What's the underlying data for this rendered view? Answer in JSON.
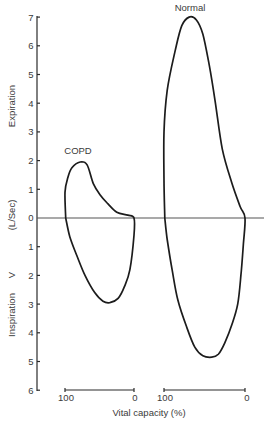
{
  "chart_data": {
    "type": "line",
    "title": "",
    "subtitle": "",
    "xlabel": "Vital capacity (%)",
    "ylabel": "V (L/Sec)",
    "ylabel_upper": "Expiration",
    "ylabel_lower": "Inspiration",
    "ylabel_unit": "(L/Sec)",
    "ylabel_symbol": "V",
    "ylim": [
      -6,
      7
    ],
    "y_ticks_expiration": [
      "7",
      "6",
      "5",
      "4",
      "3",
      "2",
      "1",
      "0"
    ],
    "y_ticks_inspiration": [
      "1",
      "2",
      "3",
      "4",
      "5",
      "6"
    ],
    "grid": false,
    "legend": "none (curves labeled directly)",
    "x_scales": [
      {
        "name": "COPD",
        "left_label": "100",
        "right_label": "0",
        "range": [
          100,
          0
        ]
      },
      {
        "name": "Normal",
        "left_label": "100",
        "right_label": "0",
        "range": [
          100,
          0
        ]
      }
    ],
    "series": [
      {
        "name": "COPD",
        "label": "COPD",
        "note": "points are [vital capacity %, flow L/s]; positive = expiration, negative = inspiration",
        "points": [
          [
            99,
            0
          ],
          [
            100,
            0.9
          ],
          [
            96,
            1.4
          ],
          [
            90,
            1.75
          ],
          [
            78,
            1.95
          ],
          [
            68,
            1.85
          ],
          [
            59,
            1.2
          ],
          [
            49,
            0.8
          ],
          [
            38,
            0.5
          ],
          [
            25,
            0.2
          ],
          [
            9,
            0.1
          ],
          [
            0,
            0
          ],
          [
            0,
            -0.6
          ],
          [
            6,
            -1.8
          ],
          [
            14,
            -2.4
          ],
          [
            23,
            -2.8
          ],
          [
            35,
            -2.95
          ],
          [
            45,
            -2.9
          ],
          [
            57,
            -2.6
          ],
          [
            71,
            -2.0
          ],
          [
            83,
            -1.3
          ],
          [
            93,
            -0.65
          ],
          [
            99,
            0
          ]
        ],
        "peak_expiratory_flow": 2.0,
        "peak_inspiratory_flow": 2.9
      },
      {
        "name": "Normal",
        "label": "Normal",
        "note": "points are [vital capacity %, flow L/s]; positive = expiration, negative = inspiration",
        "points": [
          [
            99,
            0
          ],
          [
            100,
            1.3
          ],
          [
            100,
            3.0
          ],
          [
            96,
            4.45
          ],
          [
            86,
            5.85
          ],
          [
            78,
            6.7
          ],
          [
            69,
            7.0
          ],
          [
            60,
            6.9
          ],
          [
            52,
            6.4
          ],
          [
            44,
            5.3
          ],
          [
            37,
            4.1
          ],
          [
            28,
            2.4
          ],
          [
            16,
            1.2
          ],
          [
            6,
            0.4
          ],
          [
            0,
            0
          ],
          [
            2,
            -0.9
          ],
          [
            5,
            -2.0
          ],
          [
            9,
            -3.0
          ],
          [
            16,
            -3.7
          ],
          [
            25,
            -4.35
          ],
          [
            33,
            -4.75
          ],
          [
            41,
            -4.85
          ],
          [
            52,
            -4.8
          ],
          [
            62,
            -4.5
          ],
          [
            72,
            -3.8
          ],
          [
            83,
            -2.85
          ],
          [
            90,
            -1.8
          ],
          [
            96,
            -0.75
          ],
          [
            99,
            0
          ]
        ],
        "peak_expiratory_flow": 7.0,
        "peak_inspiratory_flow": 4.8
      }
    ]
  },
  "labels": {
    "copd": "COPD",
    "normal": "Normal",
    "expiration": "Expiration",
    "inspiration": "Inspiration",
    "unit": "(L/Sec)",
    "flow_symbol": "V",
    "x_axis": "Vital capacity (%)",
    "copd_scale_left": "100",
    "copd_scale_right": "0",
    "normal_scale_left": "100",
    "normal_scale_right": "0"
  }
}
